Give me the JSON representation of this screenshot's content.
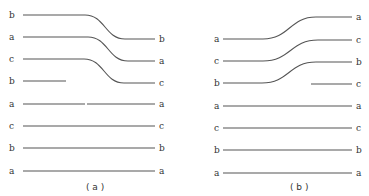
{
  "colors": {
    "line": "#555555",
    "text": "#333333",
    "background": "#ffffff"
  },
  "panels": [
    {
      "caption": "( a )",
      "caption_pos": [
        86,
        190
      ],
      "tracks": [
        {
          "left": "b",
          "ly": 15,
          "right": "b",
          "ry": 39,
          "x1": 23,
          "x2": 155,
          "curve": [
            85,
            125
          ],
          "lx": 9,
          "rx": 159
        },
        {
          "left": "a",
          "ly": 37,
          "right": "a",
          "ry": 61,
          "x1": 23,
          "x2": 155,
          "curve": [
            88,
            128
          ],
          "lx": 9,
          "rx": 159
        },
        {
          "left": "c",
          "ly": 59,
          "right": "c",
          "ry": 83,
          "x1": 23,
          "x2": 155,
          "curve": [
            84,
            124
          ],
          "lx": 9,
          "rx": 159
        },
        {
          "left": "b",
          "ly": 81,
          "right": "",
          "ry": 81,
          "x1": 23,
          "x2": 66,
          "lx": 9
        },
        {
          "left": "a",
          "ly": 104,
          "right": "a",
          "ry": 104,
          "x1": 23,
          "x2": 155,
          "gap": [
            85,
            87
          ],
          "lx": 9,
          "rx": 159
        },
        {
          "left": "c",
          "ly": 126,
          "right": "c",
          "ry": 126,
          "x1": 23,
          "x2": 155,
          "lx": 9,
          "rx": 159
        },
        {
          "left": "b",
          "ly": 148,
          "right": "b",
          "ry": 148,
          "x1": 23,
          "x2": 155,
          "lx": 9,
          "rx": 159
        },
        {
          "left": "a",
          "ly": 171,
          "right": "a",
          "ry": 171,
          "x1": 23,
          "x2": 155,
          "lx": 9,
          "rx": 159
        }
      ]
    },
    {
      "caption": "( b )",
      "caption_pos": [
        290,
        190
      ],
      "tracks": [
        {
          "left": "a",
          "ly": 39,
          "right": "a",
          "ry": 17,
          "x1": 223,
          "x2": 352,
          "curve": [
            263,
            316
          ],
          "lx": 214,
          "rx": 356
        },
        {
          "left": "c",
          "ly": 61,
          "right": "c",
          "ry": 40,
          "x1": 223,
          "x2": 352,
          "curve": [
            263,
            318
          ],
          "lx": 214,
          "rx": 356
        },
        {
          "left": "b",
          "ly": 83,
          "right": "b",
          "ry": 62,
          "x1": 223,
          "x2": 352,
          "curve": [
            262,
            316
          ],
          "lx": 214,
          "rx": 356
        },
        {
          "left": "",
          "ly": 84,
          "right": "c",
          "ry": 84,
          "x1": 311,
          "x2": 352,
          "rx": 356
        },
        {
          "left": "a",
          "ly": 106,
          "right": "a",
          "ry": 106,
          "x1": 223,
          "x2": 352,
          "lx": 214,
          "rx": 356
        },
        {
          "left": "c",
          "ly": 128,
          "right": "c",
          "ry": 128,
          "x1": 223,
          "x2": 352,
          "lx": 214,
          "rx": 356
        },
        {
          "left": "b",
          "ly": 150,
          "right": "b",
          "ry": 150,
          "x1": 223,
          "x2": 352,
          "lx": 214,
          "rx": 356
        },
        {
          "left": "a",
          "ly": 173,
          "right": "a",
          "ry": 173,
          "x1": 223,
          "x2": 352,
          "lx": 214,
          "rx": 356
        }
      ]
    }
  ]
}
